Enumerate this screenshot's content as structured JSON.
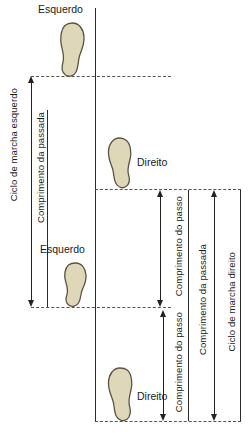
{
  "figure": {
    "background_color": "#ffffff",
    "line_color": "#2b2b2b",
    "dash_color": "#555555",
    "foot_fill": "#ded7b8",
    "foot_stroke": "#5c5346"
  },
  "footprints": [
    {
      "id": "foot-left-1",
      "label": "Esquerdo",
      "side": "left",
      "x": 58,
      "y": 22,
      "w": 27,
      "h": 55
    },
    {
      "id": "foot-right-1",
      "label": "Direito",
      "side": "right",
      "x": 107,
      "y": 137,
      "w": 26,
      "h": 52
    },
    {
      "id": "foot-left-2",
      "label": "Esquerdo",
      "side": "left",
      "x": 62,
      "y": 262,
      "w": 25,
      "h": 45
    },
    {
      "id": "foot-right-2",
      "label": "Direito",
      "side": "right",
      "x": 107,
      "y": 367,
      "w": 27,
      "h": 54
    }
  ],
  "foot_labels": [
    {
      "text": "Esquerdo",
      "x": 38,
      "y": 5
    },
    {
      "text": "Direito",
      "x": 137,
      "y": 158
    },
    {
      "text": "Esquerdo",
      "x": 40,
      "y": 245
    },
    {
      "text": "Direito",
      "x": 137,
      "y": 392
    }
  ],
  "measures": [
    {
      "id": "ciclo-marcha-esquerdo",
      "label": "Ciclo de marcha esquerdo",
      "label_x": 9,
      "label_y": 88,
      "arrow_x": 31,
      "arrow_top": 76,
      "arrow_bottom": 307,
      "heads": "both"
    },
    {
      "id": "comprimento-passada-esquerda",
      "label": "Comprimento da passada",
      "label_x": 47,
      "label_y": 110,
      "arrow_x": null,
      "arrow_top": null,
      "arrow_bottom": null,
      "heads": "none"
    },
    {
      "id": "comprimento-passo-1",
      "label": "Comprimento do passo",
      "label_x": 175,
      "label_y": 196,
      "arrow_x": 160,
      "arrow_top": 190,
      "arrow_bottom": 307,
      "heads": "both"
    },
    {
      "id": "comprimento-passo-2",
      "label": "Comprimento do passo",
      "label_x": 175,
      "label_y": 312,
      "arrow_x": 163,
      "arrow_top": 310,
      "arrow_bottom": 421,
      "heads": "both"
    },
    {
      "id": "comprimento-passada-direita",
      "label": "Comprimento da passada",
      "label_x": 200,
      "label_y": 236,
      "arrow_x": 214,
      "arrow_top": 190,
      "arrow_bottom": 421,
      "heads": "both"
    },
    {
      "id": "ciclo-marcha-direito",
      "label": "Ciclo de marcha direito",
      "label_x": 228,
      "label_y": 248,
      "arrow_x": null,
      "arrow_top": null,
      "arrow_bottom": null,
      "heads": "none"
    }
  ],
  "guides": {
    "vertical_lines": [
      {
        "id": "midline",
        "x": 95,
        "y": 8,
        "h": 413
      },
      {
        "id": "left-axis",
        "x": 47,
        "y": 110,
        "h": 197
      },
      {
        "id": "right-axis-1",
        "x": 188,
        "y": 190,
        "h": 231
      },
      {
        "id": "right-axis-2",
        "x": 240,
        "y": 190,
        "h": 231
      }
    ],
    "dashed_lines": [
      {
        "id": "dash-left-1",
        "x": 31,
        "y": 76,
        "w": 140
      },
      {
        "id": "dash-right-1",
        "x": 95,
        "y": 189,
        "w": 146
      },
      {
        "id": "dash-left-2",
        "x": 31,
        "y": 307,
        "w": 140
      },
      {
        "id": "dash-right-2",
        "x": 95,
        "y": 421,
        "w": 146
      }
    ]
  },
  "caption": {
    "line1": "Figura 1 – Representação do ciclo de marcha,",
    "visible": false
  }
}
